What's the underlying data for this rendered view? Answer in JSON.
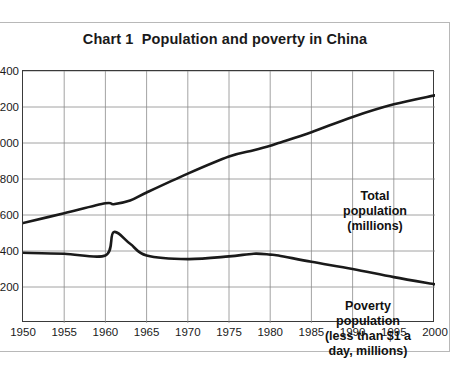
{
  "chart_data": {
    "type": "line",
    "title": "Chart 1  Population and poverty in China",
    "xlabel": "",
    "ylabel": "",
    "xlim": [
      1950,
      2000
    ],
    "ylim": [
      0,
      1400
    ],
    "grid": true,
    "legend_position": "inline-annotations",
    "x_ticks": [
      "1950",
      "1955",
      "1960",
      "1965",
      "1970",
      "1975",
      "1980",
      "1985",
      "1990",
      "1995",
      "2000"
    ],
    "y_ticks": [
      "1400",
      "1200",
      "1000",
      "800",
      "600",
      "400",
      "200"
    ],
    "y_ticks_clipped_note": "leading digits cut off at left image edge",
    "x": [
      1950,
      1955,
      1960,
      1961,
      1963,
      1965,
      1970,
      1975,
      1978,
      1980,
      1981,
      1985,
      1990,
      1995,
      2000
    ],
    "series": [
      {
        "name": "Total population (millions)",
        "color": "#1a1a1a",
        "values": [
          555,
          610,
          665,
          660,
          680,
          725,
          830,
          925,
          960,
          985,
          1000,
          1060,
          1145,
          1215,
          1265
        ]
      },
      {
        "name": "Poverty population (less than $1 a day, millions)",
        "color": "#1a1a1a",
        "values": [
          390,
          385,
          375,
          505,
          440,
          375,
          355,
          370,
          385,
          380,
          375,
          340,
          300,
          255,
          215
        ]
      }
    ],
    "annotations": [
      {
        "id": "total-population",
        "text": "Total\npopulation\n(millions)",
        "target_series": "Total population (millions)"
      },
      {
        "id": "poverty-population",
        "text": "Poverty\npopulation\n(less than $1 a\nday, millions)",
        "target_series": "Poverty population (less than $1 a day, millions)"
      }
    ]
  }
}
